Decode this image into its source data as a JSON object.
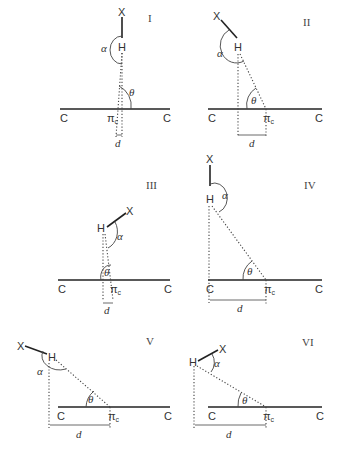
{
  "figure": {
    "labels": {
      "x_atom": "X",
      "h_atom": "H",
      "carbon": "C",
      "pi": "π",
      "pi_sub": "c",
      "alpha": "α",
      "theta": "θ",
      "distance": "d"
    },
    "panels": [
      {
        "id": "I",
        "numeral": "I"
      },
      {
        "id": "II",
        "numeral": "II"
      },
      {
        "id": "III",
        "numeral": "III"
      },
      {
        "id": "IV",
        "numeral": "IV"
      },
      {
        "id": "V",
        "numeral": "V"
      },
      {
        "id": "VI",
        "numeral": "VI"
      }
    ]
  }
}
